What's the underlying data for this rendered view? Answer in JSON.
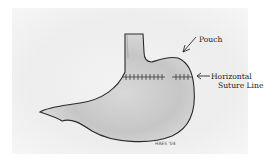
{
  "diagram": {
    "labels": {
      "pouch": "Pouch",
      "suture_line_1": "Horizontal",
      "suture_line_2": "Suture Line"
    },
    "signature": "HAES '04",
    "colors": {
      "outline": "#2a2a2a",
      "shading": "#bdbdbd",
      "background": "#ececec"
    }
  }
}
